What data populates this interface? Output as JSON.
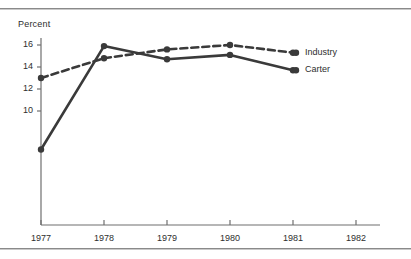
{
  "chart_data": {
    "type": "line",
    "title": "",
    "xlabel": "",
    "ylabel": "Percent",
    "ylabel_text": "Percent",
    "categories": [
      "1977",
      "1978",
      "1979",
      "1980",
      "1981",
      "1982"
    ],
    "x": [
      1977,
      1978,
      1979,
      1980,
      1981,
      1982
    ],
    "xlim": [
      1977,
      1982
    ],
    "ylim": [
      2,
      17
    ],
    "yticks": [
      16,
      14,
      12,
      10
    ],
    "ytick_labels": [
      "16",
      "14",
      "12",
      "10"
    ],
    "xtick_labels": [
      "1977",
      "1978",
      "1979",
      "1980",
      "1981",
      "1982"
    ],
    "grid": false,
    "legend_position": "right",
    "series": [
      {
        "name": "Industry",
        "style": "dashed",
        "color": "#3a3a3a",
        "x": [
          1977,
          1978,
          1979,
          1980,
          1981
        ],
        "values": [
          13.0,
          14.8,
          15.6,
          16.0,
          15.3
        ]
      },
      {
        "name": "Carter",
        "style": "solid",
        "color": "#3a3a3a",
        "x": [
          1977,
          1978,
          1979,
          1980,
          1981
        ],
        "values": [
          6.5,
          15.9,
          14.7,
          15.1,
          13.7
        ]
      }
    ],
    "legend": [
      {
        "label": "Industry",
        "style": "dashed",
        "color": "#3a3a3a"
      },
      {
        "label": "Carter",
        "style": "solid",
        "color": "#3a3a3a"
      }
    ],
    "annotations": []
  },
  "colors": {
    "line": "#3a3a3a",
    "axis": "#6f6f6f",
    "rule": "#8a8a8a",
    "text": "#2e2e2e",
    "background": "#ffffff"
  }
}
